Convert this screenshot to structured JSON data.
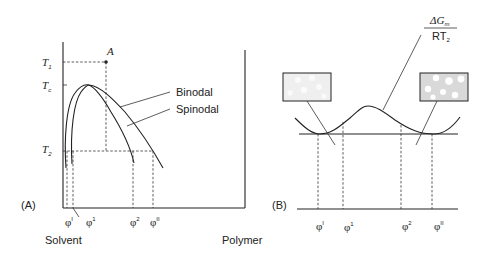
{
  "figure": {
    "panel_a": {
      "label": "(A)",
      "y_axis_labels": [
        {
          "main": "T",
          "sub": "1"
        },
        {
          "main": "T",
          "sub": "c"
        },
        {
          "main": "T",
          "sub": "2"
        }
      ],
      "point_label": "A",
      "curve_labels": [
        "Binodal",
        "Spinodal"
      ],
      "x_ticks": [
        {
          "main": "φ",
          "sup": "I"
        },
        {
          "main": "φ",
          "sup": "1"
        },
        {
          "main": "φ",
          "sup": "2"
        },
        {
          "main": "φ",
          "sup": "II"
        }
      ],
      "x_axis_left": "Solvent",
      "x_axis_right": "Polymer"
    },
    "panel_b": {
      "label": "(B)",
      "curve_label_numerator": {
        "main": "ΔG",
        "sub": "m"
      },
      "curve_label_denominator": {
        "main": "RT",
        "sub": "2"
      },
      "x_ticks": [
        {
          "main": "φ",
          "sup": "I"
        },
        {
          "main": "φ",
          "sup": "1"
        },
        {
          "main": "φ",
          "sup": "2"
        },
        {
          "main": "φ",
          "sup": "II"
        }
      ],
      "insets": [
        "dilute-phase-morphology",
        "concentrated-phase-morphology"
      ]
    },
    "colors": {
      "line": "#222222",
      "inset_left_fill": "#efefef",
      "inset_right_fill": "#d9d9d9",
      "droplet": "#ffffff"
    }
  }
}
